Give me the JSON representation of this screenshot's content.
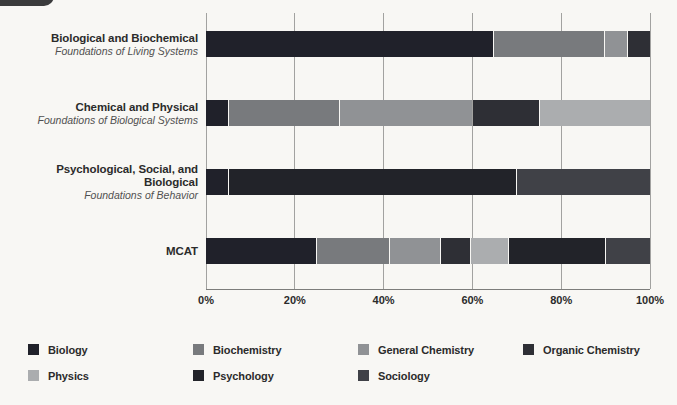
{
  "page": {
    "background": "#f8f7f4",
    "tab_color": "#3b3b3c"
  },
  "chart_data": {
    "type": "bar",
    "orientation": "horizontal",
    "stacked": true,
    "unit": "%",
    "xlim": [
      0,
      100
    ],
    "grid": true,
    "legend_position": "bottom",
    "x_ticks": [
      "0%",
      "20%",
      "40%",
      "60%",
      "80%",
      "100%"
    ],
    "series_colors": {
      "Biology": "#20212a",
      "Biochemistry": "#787a7d",
      "General Chemistry": "#909295",
      "Organic Chemistry": "#2e2f35",
      "Physics": "#abadaf",
      "Psychology": "#222329",
      "Sociology": "#404147"
    },
    "rows": [
      {
        "label": "Biological and Biochemical",
        "sublabel": "Foundations of Living Systems",
        "segments": [
          {
            "name": "Biology",
            "value": 65
          },
          {
            "name": "Biochemistry",
            "value": 25
          },
          {
            "name": "General Chemistry",
            "value": 5
          },
          {
            "name": "Organic Chemistry",
            "value": 5
          }
        ]
      },
      {
        "label": "Chemical and Physical",
        "sublabel": "Foundations of Biological Systems",
        "segments": [
          {
            "name": "Biology",
            "value": 5
          },
          {
            "name": "Biochemistry",
            "value": 25
          },
          {
            "name": "General Chemistry",
            "value": 30
          },
          {
            "name": "Organic Chemistry",
            "value": 15
          },
          {
            "name": "Physics",
            "value": 25
          }
        ]
      },
      {
        "label": "Psychological, Social, and Biological",
        "sublabel": "Foundations of Behavior",
        "segments": [
          {
            "name": "Biology",
            "value": 5
          },
          {
            "name": "Psychology",
            "value": 65
          },
          {
            "name": "Sociology",
            "value": 30
          }
        ]
      },
      {
        "label": "MCAT",
        "sublabel": "",
        "segments": [
          {
            "name": "Biology",
            "value": 25
          },
          {
            "name": "Biochemistry",
            "value": 16.5
          },
          {
            "name": "General Chemistry",
            "value": 11.5
          },
          {
            "name": "Organic Chemistry",
            "value": 6.5
          },
          {
            "name": "Physics",
            "value": 8.5
          },
          {
            "name": "Psychology",
            "value": 22
          },
          {
            "name": "Sociology",
            "value": 10
          }
        ]
      }
    ],
    "legend": [
      {
        "name": "Biology",
        "color": "#20212a"
      },
      {
        "name": "Biochemistry",
        "color": "#787a7d"
      },
      {
        "name": "General Chemistry",
        "color": "#909295"
      },
      {
        "name": "Organic Chemistry",
        "color": "#2e2f35"
      },
      {
        "name": "Physics",
        "color": "#abadaf"
      },
      {
        "name": "Psychology",
        "color": "#222329"
      },
      {
        "name": "Sociology",
        "color": "#404147"
      }
    ]
  }
}
